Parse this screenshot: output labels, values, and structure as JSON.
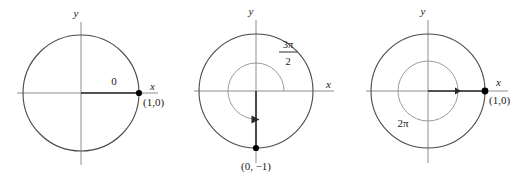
{
  "figure": {
    "type": "math-diagram-set",
    "background_color": "#ffffff",
    "width": 528,
    "height": 177
  },
  "colors": {
    "axis": "#8e8e8e",
    "circle": "#4a4a4a",
    "inner_arc": "#9a9a9a",
    "ray": "#2b2b2b",
    "point": "#000000",
    "text": "#1a1a1a"
  },
  "diagrams": [
    {
      "id": "diagram-0",
      "angle_label": "0",
      "angle_value_radians": 0,
      "x_axis_label": "x",
      "y_axis_label": "y",
      "point_label": "(1,0)",
      "point_coords": [
        1,
        0
      ],
      "center": [
        81,
        93
      ],
      "radius": 58,
      "has_inner_arc": false,
      "terminal_side_degrees": 0
    },
    {
      "id": "diagram-3pi-2",
      "angle_label_numerator": "3π",
      "angle_label_denominator": "2",
      "angle_label": "3π/2",
      "angle_value_radians": 4.712,
      "x_axis_label": "x",
      "y_axis_label": "y",
      "point_label": "(0, −1)",
      "point_coords": [
        0,
        -1
      ],
      "center": [
        256,
        91
      ],
      "radius": 57,
      "has_inner_arc": true,
      "inner_arc_radius": 28,
      "terminal_side_degrees": 270
    },
    {
      "id": "diagram-2pi",
      "angle_label": "2π",
      "angle_value_radians": 6.283,
      "x_axis_label": "x",
      "y_axis_label": "y",
      "point_label": "(1,0)",
      "point_coords": [
        1,
        0
      ],
      "center": [
        428,
        91
      ],
      "radius": 57,
      "has_inner_arc": true,
      "inner_arc_radius": 30,
      "terminal_side_degrees": 360
    }
  ]
}
